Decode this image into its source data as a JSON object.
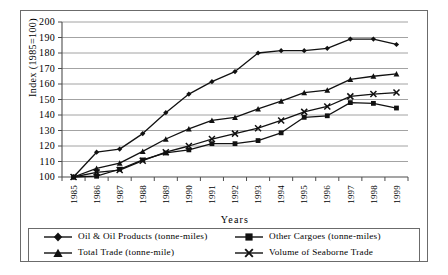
{
  "chart_data": {
    "type": "line",
    "title": "",
    "xlabel": "Years",
    "ylabel": "Index (1985=100)",
    "ylim": [
      100,
      200
    ],
    "ytick_step": 10,
    "yticks": [
      100,
      110,
      120,
      130,
      140,
      150,
      160,
      170,
      180,
      190,
      200
    ],
    "grid": true,
    "legend_position": "bottom",
    "categories": [
      "1985",
      "1986",
      "1987",
      "1988",
      "1989",
      "1990",
      "1991",
      "1992",
      "1993",
      "1994",
      "1995",
      "1996",
      "1997",
      "1998",
      "1999"
    ],
    "series": [
      {
        "name": "Oil & Oil Products (tonne-miles)",
        "marker": "diamond",
        "values": [
          100,
          116,
          118,
          128,
          141.5,
          153.5,
          161.5,
          168,
          180,
          181.5,
          181.5,
          183,
          189,
          189,
          185.5
        ]
      },
      {
        "name": "Other Cargoes (tonne-miles)",
        "marker": "square",
        "values": [
          100,
          100.5,
          105,
          111,
          115.5,
          117.5,
          121.5,
          121.5,
          123.5,
          128.5,
          138.5,
          139.5,
          148,
          147.5,
          144.5
        ]
      },
      {
        "name": "Total Trade (tonne-mile)",
        "marker": "triangle",
        "values": [
          100,
          105.5,
          109,
          116.5,
          124.5,
          131,
          136.5,
          138.5,
          144,
          149,
          154.5,
          156,
          163,
          165,
          166.5
        ]
      },
      {
        "name": "Volume of Seaborne Trade",
        "marker": "cross",
        "values": [
          100,
          103,
          104.5,
          110.5,
          116,
          120,
          124.5,
          128,
          131.5,
          136.5,
          142,
          145.5,
          152,
          153.5,
          154.5
        ]
      }
    ]
  },
  "legend": {
    "items": [
      {
        "label": "Oil & Oil Products (tonne-miles)",
        "marker": "diamond"
      },
      {
        "label": "Other Cargoes (tonne-miles)",
        "marker": "square"
      },
      {
        "label": "Total Trade (tonne-mile)",
        "marker": "triangle"
      },
      {
        "label": "Volume of Seaborne Trade",
        "marker": "cross"
      }
    ]
  },
  "style": {
    "line_color": "#111111",
    "grid_color": "#8c8c8c",
    "axis_color": "#4d4d4d",
    "frame_color": "#6b6b6b",
    "background": "#ffffff"
  }
}
